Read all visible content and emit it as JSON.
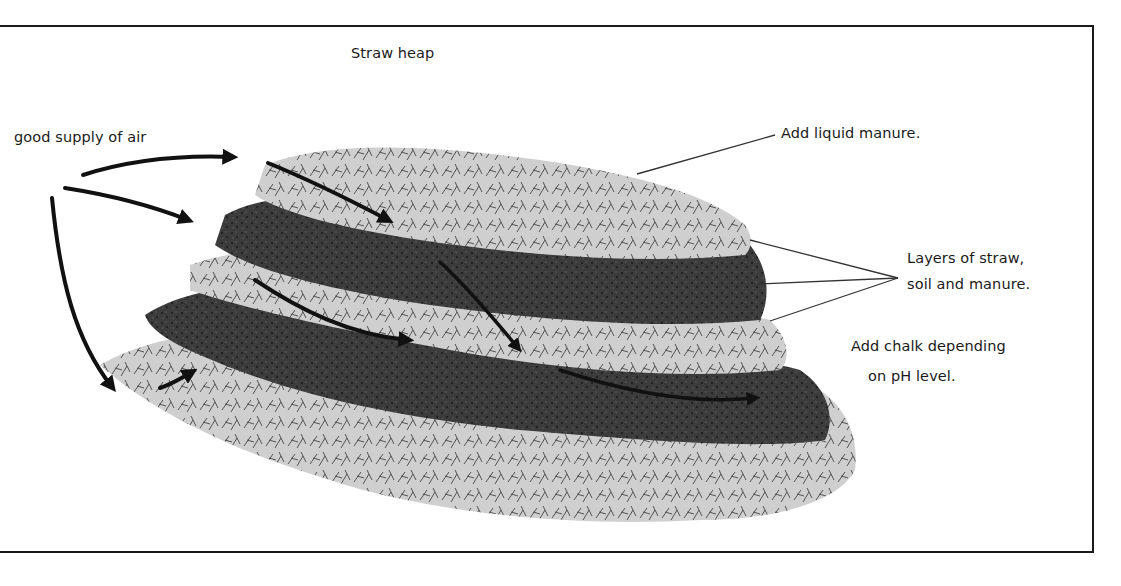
{
  "diagram": {
    "title": "Straw heap",
    "labels": {
      "air": "good supply of air",
      "liquid_manure": "Add liquid manure.",
      "layers_line1": "Layers of straw,",
      "layers_line2": "soil and manure.",
      "chalk_line1": "Add chalk depending",
      "chalk_line2": "on pH level."
    },
    "colors": {
      "straw": "#c9c9c9",
      "straw_light": "#dedede",
      "soil": "#3a3a3a",
      "soil_mid": "#5a5a5a",
      "ink": "#1a1a1a"
    }
  }
}
